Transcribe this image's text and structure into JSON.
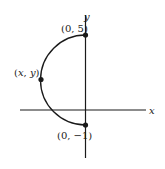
{
  "diagram": {
    "type": "semicircle-on-axes",
    "axes": {
      "x_label": "x",
      "y_label": "y"
    },
    "points": [
      {
        "id": "top",
        "label": "(0, 5)",
        "x": 0,
        "y": 5
      },
      {
        "id": "left",
        "label": "(x, y)"
      },
      {
        "id": "bottom",
        "label": "(0, −1)",
        "x": 0,
        "y": -1
      }
    ],
    "curve": "left semicircle from (0, 5) to (0, −1) through (x, y)",
    "colors": {
      "ink": "#1a1a1a",
      "background": "#ffffff"
    }
  }
}
